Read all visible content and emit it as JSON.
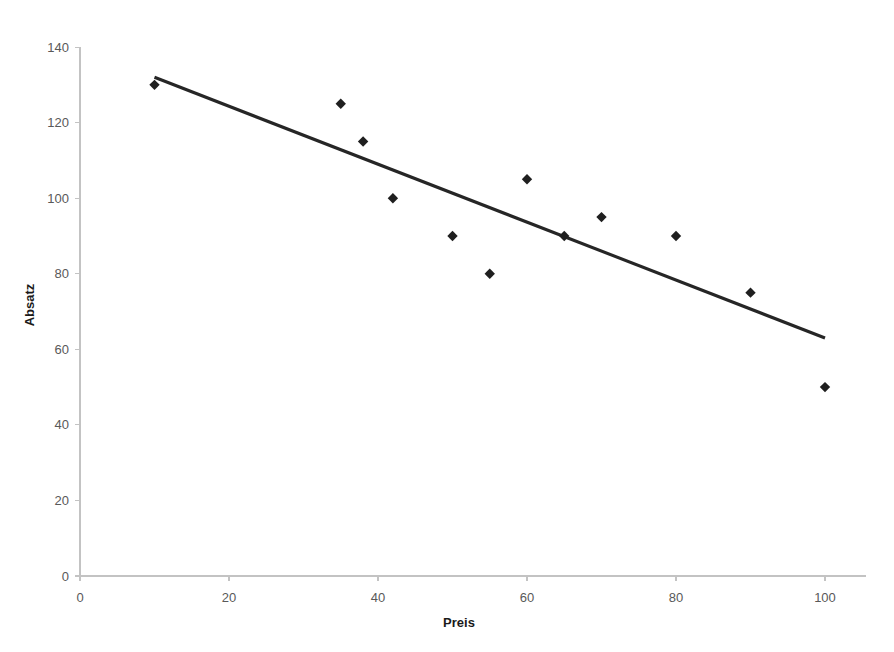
{
  "chart_data": {
    "type": "scatter",
    "title": "",
    "xlabel": "Preis",
    "ylabel": "Absatz",
    "xlim": [
      0,
      105
    ],
    "ylim": [
      0,
      140
    ],
    "xticks": [
      0,
      20,
      40,
      60,
      80,
      100
    ],
    "yticks": [
      0,
      20,
      40,
      60,
      80,
      100,
      120,
      140
    ],
    "grid": false,
    "legend": false,
    "legend_position": "none",
    "marker_shape": "diamond",
    "marker_color": "#1f1f1f",
    "series": [
      {
        "name": "Absatz",
        "type": "scatter",
        "points": [
          {
            "x": 10,
            "y": 130
          },
          {
            "x": 35,
            "y": 125
          },
          {
            "x": 38,
            "y": 115
          },
          {
            "x": 42,
            "y": 100
          },
          {
            "x": 50,
            "y": 90
          },
          {
            "x": 55,
            "y": 80
          },
          {
            "x": 60,
            "y": 105
          },
          {
            "x": 65,
            "y": 90
          },
          {
            "x": 70,
            "y": 95
          },
          {
            "x": 80,
            "y": 90
          },
          {
            "x": 90,
            "y": 75
          },
          {
            "x": 100,
            "y": 50
          }
        ]
      },
      {
        "name": "Trendlinie",
        "type": "line",
        "color": "#262626",
        "points": [
          {
            "x": 10,
            "y": 132
          },
          {
            "x": 100,
            "y": 63
          }
        ]
      }
    ]
  },
  "axes": {
    "x_tick_labels": [
      "0",
      "20",
      "40",
      "60",
      "80",
      "100"
    ],
    "y_tick_labels": [
      "0",
      "20",
      "40",
      "60",
      "80",
      "100",
      "120",
      "140"
    ],
    "x_axis_title": "Preis",
    "y_axis_title": "Absatz"
  }
}
